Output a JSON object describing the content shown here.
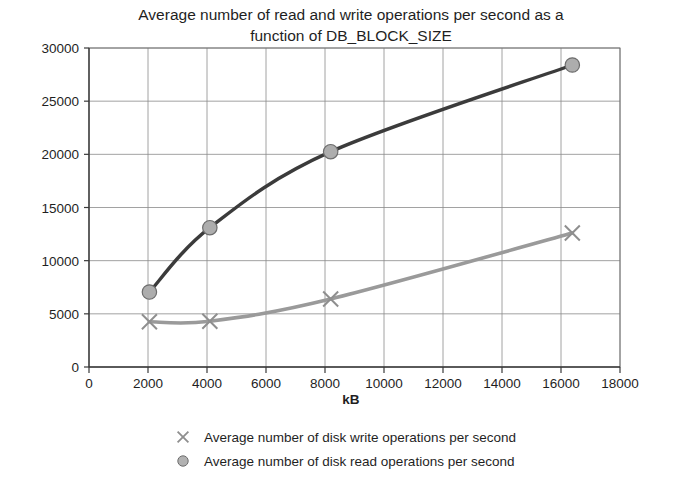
{
  "chart_data": {
    "type": "line",
    "title": "Average number of read and write operations per second as a function of DB_BLOCK_SIZE",
    "title_line1": "Average number of read and write operations per second as a",
    "title_line2": "function of DB_BLOCK_SIZE",
    "xlabel": "kB",
    "ylabel": "",
    "x": [
      2048,
      4096,
      8192,
      16384
    ],
    "xlim": [
      0,
      18000
    ],
    "ylim": [
      0,
      30000
    ],
    "xticks": [
      0,
      2000,
      4000,
      6000,
      8000,
      10000,
      12000,
      14000,
      16000,
      18000
    ],
    "yticks": [
      0,
      5000,
      10000,
      15000,
      20000,
      25000,
      30000
    ],
    "xtick_labels": [
      "0",
      "2000",
      "4000",
      "6000",
      "8000",
      "10000",
      "12000",
      "14000",
      "16000",
      "18000"
    ],
    "ytick_labels": [
      "0",
      "5000",
      "10000",
      "15000",
      "20000",
      "25000",
      "30000"
    ],
    "grid": true,
    "legend_position": "bottom",
    "series": [
      {
        "name": "Average number of disk write operations per second",
        "marker": "x",
        "color": "#9a9a9a",
        "values": [
          4250,
          4300,
          6400,
          12600
        ]
      },
      {
        "name": "Average number of disk read operations per second",
        "marker": "circle",
        "color": "#3b3b3b",
        "values": [
          7050,
          13100,
          20250,
          28400
        ]
      }
    ]
  },
  "legend": {
    "items": [
      {
        "label": "Average number of disk write operations per second",
        "marker": "x-marker",
        "color": "#9a9a9a"
      },
      {
        "label": "Average number of disk read operations per second",
        "marker": "circle-marker",
        "color": "#7d7d7d"
      }
    ]
  }
}
